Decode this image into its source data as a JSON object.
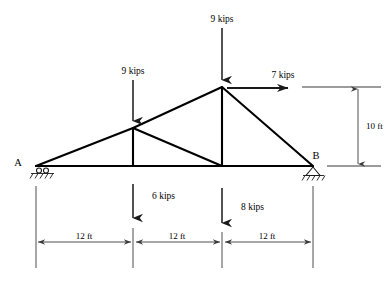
{
  "diagram": {
    "colors": {
      "stroke": "#000000",
      "dimension": "#3a3a3a",
      "background": "#ffffff"
    },
    "nodes": [
      {
        "id": "A",
        "label": "A",
        "x": 36,
        "y": 166,
        "support": "roller"
      },
      {
        "id": "B",
        "label": "B",
        "x": 313,
        "y": 166,
        "support": "pin"
      },
      {
        "id": "C",
        "label": "",
        "x": 133,
        "y": 128,
        "support": "none"
      },
      {
        "id": "D",
        "label": "",
        "x": 222,
        "y": 87,
        "support": "none"
      },
      {
        "id": "E",
        "label": "",
        "x": 133,
        "y": 166,
        "support": "none"
      },
      {
        "id": "F",
        "label": "",
        "x": 222,
        "y": 166,
        "support": "none"
      }
    ],
    "loads": [
      {
        "name": "top-apex-load",
        "label": "9 kips",
        "magnitude": 9,
        "unit": "kips",
        "direction": "down",
        "applied_at": "D",
        "label_x": 222,
        "label_y": 22
      },
      {
        "name": "upper-left-load",
        "label": "9 kips",
        "magnitude": 9,
        "unit": "kips",
        "direction": "down",
        "applied_at": "C",
        "label_x": 133,
        "label_y": 74
      },
      {
        "name": "horizontal-apex-load",
        "label": "7 kips",
        "magnitude": 7,
        "unit": "kips",
        "direction": "right",
        "applied_at": "D",
        "label_x": 283,
        "label_y": 78
      },
      {
        "name": "lower-left-load",
        "label": "6 kips",
        "magnitude": 6,
        "unit": "kips",
        "direction": "down",
        "applied_at": "E",
        "label_x": 152,
        "label_y": 199
      },
      {
        "name": "lower-mid-load",
        "label": "8 kips",
        "magnitude": 8,
        "unit": "kips",
        "direction": "down",
        "applied_at": "F",
        "label_x": 241,
        "label_y": 210
      }
    ],
    "dimensions": {
      "horizontal": {
        "unit": "ft",
        "spans": [
          {
            "label": "12 ft",
            "value": 12,
            "from_x": 36,
            "to_x": 133,
            "label_x": 84
          },
          {
            "label": "12 ft",
            "value": 12,
            "from_x": 133,
            "to_x": 222,
            "label_x": 177
          },
          {
            "label": "12 ft",
            "value": 12,
            "from_x": 222,
            "to_x": 313,
            "label_x": 267
          }
        ],
        "line_y": 242
      },
      "vertical": {
        "label": "10 ft",
        "value": 10,
        "unit": "ft",
        "top_y": 87,
        "bottom_y": 166,
        "line_x": 358,
        "label_x": 368,
        "label_y": 125
      }
    }
  }
}
